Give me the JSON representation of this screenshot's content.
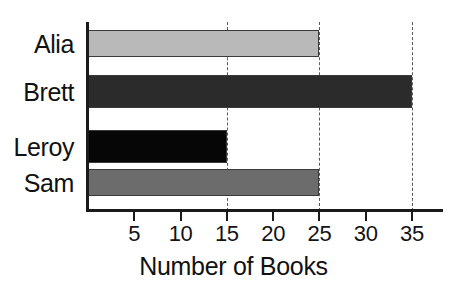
{
  "chart_data": {
    "type": "bar",
    "orientation": "horizontal",
    "title": "",
    "xlabel": "Number of Books",
    "ylabel": "",
    "categories": [
      "Alia",
      "Brett",
      "Leroy",
      "Sam"
    ],
    "values": [
      25,
      35,
      15,
      25
    ],
    "series": [
      {
        "name": "Number of Books",
        "values": [
          25,
          35,
          15,
          25
        ]
      }
    ],
    "bar_colors": [
      "#b9b9b9",
      "#2b2b2b",
      "#060606",
      "#6c6c6c"
    ],
    "xlim": [
      0,
      38.5
    ],
    "xticks": [
      5,
      10,
      15,
      20,
      25,
      30,
      35
    ],
    "xtick_labels": [
      "5",
      "10",
      "15",
      "20",
      "25",
      "30",
      "35"
    ],
    "gridlines_at": [
      15,
      25,
      35
    ],
    "grid": "dashed-vertical",
    "legend": "none",
    "axis_color": "#1a1a1a",
    "background": "#ffffff"
  },
  "bars": [
    {
      "label": "Alia",
      "value": 25,
      "color": "#b9b9b9"
    },
    {
      "label": "Brett",
      "value": 35,
      "color": "#2b2b2b"
    },
    {
      "label": "Leroy",
      "value": 15,
      "color": "#060606"
    },
    {
      "label": "Sam",
      "value": 25,
      "color": "#6c6c6c"
    }
  ],
  "ticks": [
    {
      "value": 5,
      "label": "5"
    },
    {
      "value": 10,
      "label": "10"
    },
    {
      "value": 15,
      "label": "15"
    },
    {
      "value": 20,
      "label": "20"
    },
    {
      "value": 25,
      "label": "25"
    },
    {
      "value": 30,
      "label": "30"
    },
    {
      "value": 35,
      "label": "35"
    }
  ],
  "gridlines": [
    15,
    25,
    35
  ],
  "axis": {
    "x_title": "Number of Books"
  }
}
